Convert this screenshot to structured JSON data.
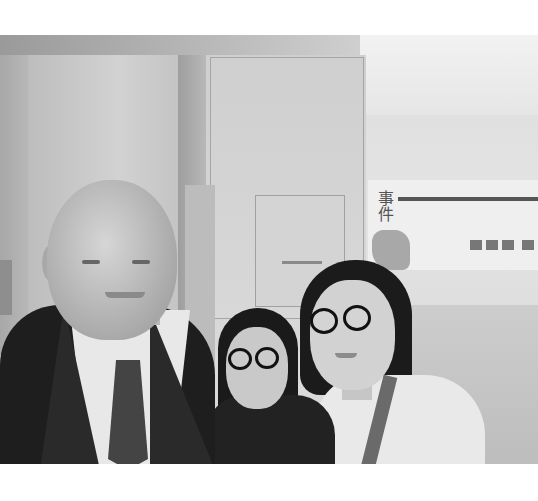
{
  "image": {
    "description": "Grayscale selfie of three people in a museum/exhibition hall",
    "subjects": [
      {
        "label": "man",
        "details": "bald older man in dark suit, white shirt, striped tie"
      },
      {
        "label": "woman-center",
        "details": "woman with short dark hair and round glasses, dark top"
      },
      {
        "label": "woman-right",
        "details": "woman with shoulder-length dark hair and round glasses, light t-shirt, bag strap"
      }
    ],
    "background": {
      "poster_text": "事件"
    }
  }
}
